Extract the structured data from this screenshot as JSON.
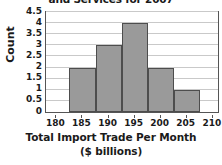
{
  "chart_data": {
    "type": "bar",
    "title": "and Services for 2007",
    "title_note": "title is clipped at the top edge of the screenshot",
    "xlabel_line1": "Total Import Trade Per Month",
    "xlabel_line2": "($ billions)",
    "ylabel": "Count",
    "xlim": [
      178,
      211
    ],
    "ylim": [
      0,
      4.5
    ],
    "grid": true,
    "legend": "none",
    "xticks": [
      180,
      185,
      190,
      195,
      200,
      205,
      210
    ],
    "xtick_labels": [
      "180",
      "185",
      "190",
      "195",
      "200",
      "205",
      "210"
    ],
    "yticks": [
      0,
      0.5,
      1,
      1.5,
      2,
      2.5,
      3,
      3.5,
      4,
      4.5
    ],
    "ytick_labels": [
      "0",
      "0.5",
      "1",
      "1.5",
      "2",
      "2.5",
      "3",
      "3.5",
      "4",
      "4.5"
    ],
    "bin_edges": [
      182.5,
      187.5,
      192.5,
      197.5,
      202.5,
      207.5
    ],
    "categories": [
      "182.5-187.5",
      "187.5-192.5",
      "192.5-197.5",
      "197.5-202.5",
      "202.5-207.5"
    ],
    "values": [
      2,
      3,
      4,
      2,
      1
    ],
    "bars": [
      {
        "left": 182.5,
        "right": 187.5,
        "count": 2
      },
      {
        "left": 187.5,
        "right": 192.5,
        "count": 3
      },
      {
        "left": 192.5,
        "right": 197.5,
        "count": 4
      },
      {
        "left": 197.5,
        "right": 202.5,
        "count": 2
      },
      {
        "left": 202.5,
        "right": 207.5,
        "count": 1
      }
    ],
    "colors": {
      "bar_fill": "#9a9a9a",
      "bar_edge": "#4d4d4d",
      "grid": "#c9c9c9",
      "axis": "#555555",
      "text": "#1a1a1a",
      "background": "#ffffff"
    }
  }
}
